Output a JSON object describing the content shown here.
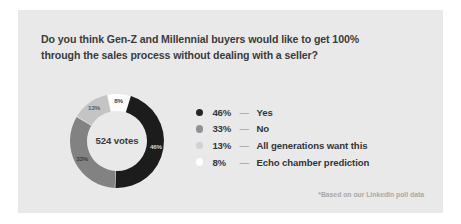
{
  "card": {
    "background_color": "#e9e9e9",
    "headline_line_1": "Do you think Gen-Z and Millennial buyers would like to get 100%",
    "headline_line_2": "through the sales process without dealing with a seller?",
    "footnote": "*Based on our LinkedIn poll data"
  },
  "chart_data": {
    "type": "pie",
    "title": "Do you think Gen-Z and Millennial buyers would like to get 100% through the sales process without dealing with a seller?",
    "center_label": "524 votes",
    "total_votes": 524,
    "legend_position": "right",
    "categories": [
      "Yes",
      "No",
      "All generations want this",
      "Echo chamber prediction"
    ],
    "values": [
      46,
      33,
      13,
      8
    ],
    "value_labels": [
      "46%",
      "33%",
      "13%",
      "8%"
    ],
    "colors": [
      "#1c1c1c",
      "#828282",
      "#c4c4c4",
      "#ffffff"
    ],
    "slices": [
      {
        "label": "Yes",
        "value": 46,
        "value_label": "46%",
        "color": "#1c1c1c",
        "label_color": "#d8d8d8"
      },
      {
        "label": "No",
        "value": 33,
        "value_label": "33%",
        "color": "#828282",
        "label_color": "#3c3c3c"
      },
      {
        "label": "All generations want this",
        "value": 13,
        "value_label": "13%",
        "color": "#c4c4c4",
        "label_color": "#5a5a5a"
      },
      {
        "label": "Echo chamber prediction",
        "value": 8,
        "value_label": "8%",
        "color": "#ffffff",
        "label_color": "#3c3c3c"
      }
    ]
  },
  "legend": {
    "rows": [
      {
        "pct": "46%",
        "dash": "—",
        "label": "Yes",
        "color": "#23272b"
      },
      {
        "pct": "33%",
        "dash": "—",
        "label": "No",
        "color": "#8d9297"
      },
      {
        "pct": "13%",
        "dash": "—",
        "label": "All generations want this",
        "color": "#cfd2d4"
      },
      {
        "pct": "8%",
        "dash": "—",
        "label": "Echo chamber prediction",
        "color": "#ffffff"
      }
    ]
  }
}
